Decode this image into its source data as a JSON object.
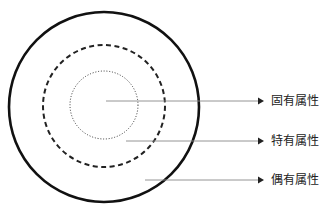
{
  "diagram": {
    "type": "concentric-circles",
    "rings": [
      {
        "name": "inner",
        "style": "dotted"
      },
      {
        "name": "middle",
        "style": "dashed"
      },
      {
        "name": "outer",
        "style": "solid"
      }
    ],
    "labels": [
      {
        "text": "固有属性",
        "points_to": "inner"
      },
      {
        "text": "特有属性",
        "points_to": "middle"
      },
      {
        "text": "偶有属性",
        "points_to": "outer"
      }
    ]
  }
}
